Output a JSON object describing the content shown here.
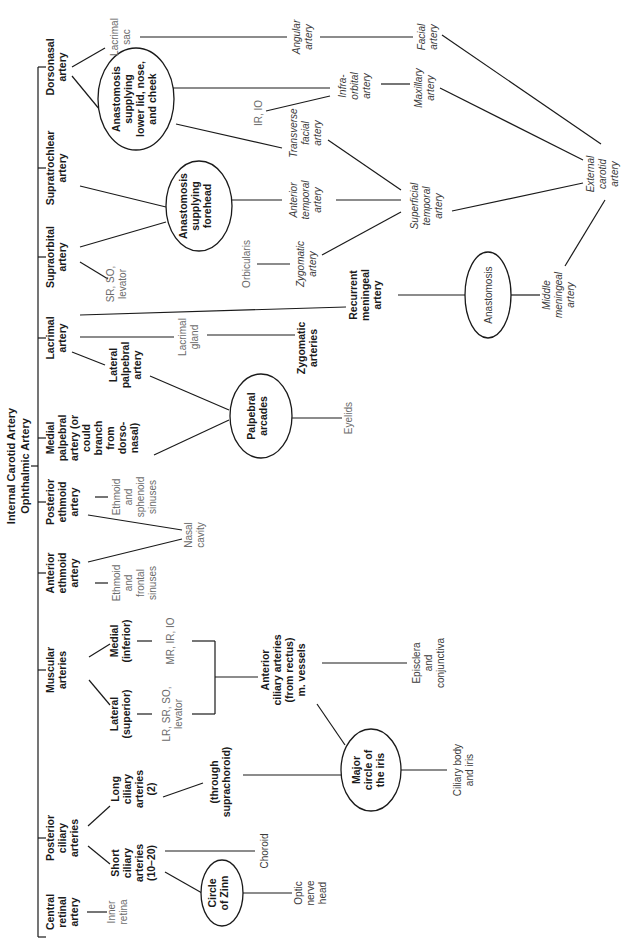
{
  "diagram": {
    "title": "Internal Carotid Artery",
    "subtitle": "Ophthalmic Artery",
    "orientation": "rotated 90° counter-clockwise (text reads bottom-to-top)",
    "primary_branches": [
      {
        "id": "central_retinal",
        "lines": [
          "Central",
          "retinal",
          "artery"
        ]
      },
      {
        "id": "posterior_ciliary",
        "lines": [
          "Posterior",
          "ciliary",
          "arteries"
        ]
      },
      {
        "id": "muscular",
        "lines": [
          "Muscular",
          "arteries"
        ]
      },
      {
        "id": "anterior_ethmoid",
        "lines": [
          "Anterior",
          "ethmoid",
          "artery"
        ]
      },
      {
        "id": "posterior_ethmoid",
        "lines": [
          "Posterior",
          "ethmoid",
          "artery"
        ]
      },
      {
        "id": "medial_palpebral",
        "lines": [
          "Medial",
          "palpebral",
          "artery (or",
          "could",
          "branch",
          "from",
          "dorso-",
          "nasal)"
        ]
      },
      {
        "id": "lacrimal",
        "lines": [
          "Lacrimal",
          "artery"
        ]
      },
      {
        "id": "supraorbital",
        "lines": [
          "Supraorbital",
          "artery"
        ]
      },
      {
        "id": "supratrochlear",
        "lines": [
          "Supratrochlear",
          "artery"
        ]
      },
      {
        "id": "dorsonasal",
        "lines": [
          "Dorsonasal",
          "artery"
        ]
      }
    ],
    "secondary_branches": {
      "short_ciliary": [
        "Short",
        "ciliary",
        "arteries",
        "(10–20)"
      ],
      "long_ciliary": [
        "Long",
        "ciliary",
        "arteries",
        "(2)"
      ],
      "lateral_superior": [
        "Lateral",
        "(superior)"
      ],
      "medial_inferior": [
        "Medial",
        "(inferior)"
      ],
      "lateral_palpebral": [
        "Lateral",
        "palpebral",
        "artery"
      ],
      "through_suprachoroid": [
        "(through",
        "suprachoroid)"
      ],
      "anterior_ciliary": [
        "Anterior",
        "ciliary arteries",
        "(from rectus)",
        "m. vessels"
      ],
      "recurrent_meningeal": [
        "Recurrent",
        "meningeal",
        "artery"
      ],
      "zygomatic_arteries": [
        "Zygomatic",
        "arteries"
      ]
    },
    "ellipses": {
      "circle_of_zinn": [
        "Circle",
        "of Zinn"
      ],
      "major_circle_iris": [
        "Major",
        "circle of",
        "the iris"
      ],
      "palpebral_arcades": [
        "Palpebral",
        "arcades"
      ],
      "anastomosis_forehead": [
        "Anastomosis",
        "supplying",
        "forehead"
      ],
      "anastomosis_lower_lid": [
        "Anastomosis",
        "supplying",
        "lower lid, nose,",
        "and cheek"
      ],
      "anastomosis_meningeal": [
        "Anastomosis"
      ]
    },
    "targets": {
      "inner_retina": [
        "Inner",
        "retina"
      ],
      "optic_nerve_head": [
        "Optic",
        "nerve",
        "head"
      ],
      "choroid": [
        "Choroid"
      ],
      "ciliary_body_iris": [
        "Ciliary body",
        "and iris"
      ],
      "lr_sr_so_levator": [
        "LR, SR, SO,",
        "levator"
      ],
      "mr_ir_io": [
        "MR, IR, IO"
      ],
      "episclera_conjunctiva": [
        "Episclera",
        "and",
        "conjunctiva"
      ],
      "ethmoid_frontal": [
        "Ethmoid",
        "and",
        "frontal",
        "sinuses"
      ],
      "ethmoid_sphenoid": [
        "Ethmoid",
        "and",
        "sphenoid",
        "sinuses"
      ],
      "nasal_cavity": [
        "Nasal",
        "cavity"
      ],
      "eyelids": [
        "Eyelids"
      ],
      "lacrimal_gland": [
        "Lacrimal",
        "gland"
      ],
      "sr_so_levator": [
        "SR, SO,",
        "levator"
      ],
      "orbicularis": [
        "Orbicularis"
      ],
      "ir_io": [
        "IR, IO"
      ],
      "lacrimal_sac": [
        "Lacrimal",
        "sac"
      ]
    },
    "external_arteries": {
      "zygomatic_artery": [
        "Zygomatic",
        "artery"
      ],
      "anterior_temporal": [
        "Anterior",
        "temporal",
        "artery"
      ],
      "transverse_facial": [
        "Transverse",
        "facial",
        "artery"
      ],
      "infraorbital": [
        "Infra-",
        "orbital",
        "artery"
      ],
      "angular": [
        "Angular",
        "artery"
      ],
      "superficial_temporal": [
        "Superficial",
        "temporal",
        "artery"
      ],
      "maxillary": [
        "Maxillary",
        "artery"
      ],
      "facial": [
        "Facial",
        "artery"
      ],
      "external_carotid": [
        "External",
        "carotid",
        "artery"
      ],
      "middle_meningeal": [
        "Middle",
        "meningeal",
        "artery"
      ]
    },
    "colors": {
      "line": "#1a1a1a",
      "bold_text": "#1a1a1a",
      "target_text": "#6b6b6b",
      "italic_text": "#3a3a3a",
      "background": "#ffffff"
    }
  }
}
